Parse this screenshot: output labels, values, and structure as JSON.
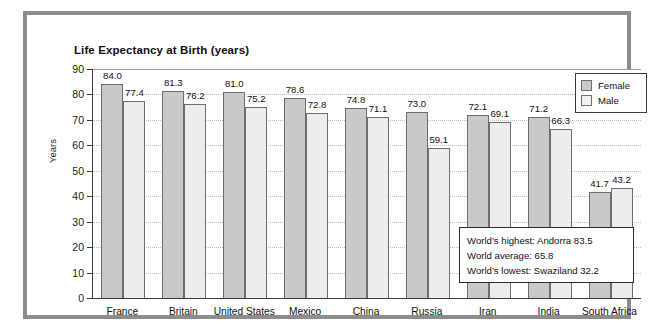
{
  "chart_data": {
    "type": "bar",
    "title": "Life Expectancy at Birth (years)",
    "xlabel": "",
    "ylabel": "Years",
    "ylim": [
      0,
      90
    ],
    "ytick_step": 10,
    "yticks": [
      90,
      80,
      70,
      60,
      50,
      40,
      30,
      20,
      10,
      0
    ],
    "grid": true,
    "legend_position": "top-right",
    "categories": [
      "France",
      "Britain",
      "United States",
      "Mexico",
      "China",
      "Russia",
      "Iran",
      "India",
      "South Africa"
    ],
    "series": [
      {
        "name": "Female",
        "color": "#c9c9c9",
        "values": [
          84.0,
          81.3,
          81.0,
          78.6,
          74.8,
          73.0,
          72.1,
          71.2,
          41.7
        ],
        "labels": [
          "84.0",
          "81.3",
          "81.0",
          "78.6",
          "74.8",
          "73.0",
          "72.1",
          "71.2",
          "41.7"
        ]
      },
      {
        "name": "Male",
        "color": "#ededed",
        "values": [
          77.4,
          76.2,
          75.2,
          72.8,
          71.1,
          59.1,
          69.1,
          66.3,
          43.2
        ],
        "labels": [
          "77.4",
          "76.2",
          "75.2",
          "72.8",
          "71.1",
          "59.1",
          "69.1",
          "66.3",
          "43.2"
        ]
      }
    ],
    "annotations": [
      "World’s highest: Andorra 83.5",
      "World average: 65.8",
      "World’s lowest: Swaziland 32.2"
    ]
  },
  "legend": {
    "items": [
      {
        "label": "Female",
        "color": "#c9c9c9"
      },
      {
        "label": "Male",
        "color": "#f2f2f2"
      }
    ]
  },
  "colors": {
    "frame": "#8d8d8d",
    "axis": "#3a3a3a",
    "gridline": "#bfbfbf",
    "female_bar": "#c9c9c9",
    "male_bar": "#ededed",
    "bar_outline": "#6e6e6e",
    "text": "#111111"
  }
}
